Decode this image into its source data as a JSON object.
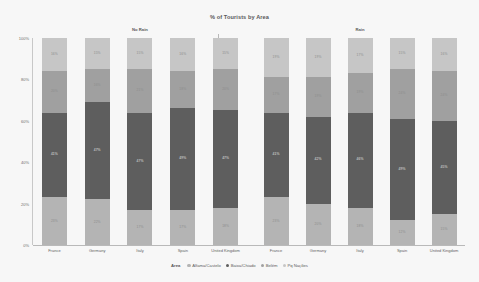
{
  "header": {
    "title": "% of Tourists by Area"
  },
  "axes": {
    "y_ticks": [
      "100%",
      "80%",
      "60%",
      "40%",
      "20%",
      "0%"
    ],
    "y_title": ""
  },
  "panels": [
    {
      "label": "No Rain"
    },
    {
      "label": "Rain"
    }
  ],
  "legend": {
    "title": "Area",
    "items": [
      {
        "label": "Alfama/Castelo",
        "color": "#b4b4b4"
      },
      {
        "label": "Baixa/Chiado",
        "color": "#5e5e5e"
      },
      {
        "label": "Belém",
        "color": "#a0a0a0"
      },
      {
        "label": "Pq Nações",
        "color": "#c6c6c6"
      }
    ]
  },
  "chart_data": {
    "type": "bar",
    "title": "% of Tourists by Area",
    "subtitle": "",
    "xlabel": "",
    "ylabel": "",
    "ylim": [
      0,
      100
    ],
    "stacked": true,
    "normalized_percent": true,
    "grid": false,
    "legend_position": "bottom",
    "legend_title": "Area",
    "facet_variable": "Rain",
    "facets": [
      "No Rain",
      "Rain"
    ],
    "categories": [
      "France",
      "Germany",
      "Italy",
      "Spain",
      "United Kingdom"
    ],
    "series_order": [
      "Alfama/Castelo",
      "Baixa/Chiado",
      "Belém",
      "Pq Nações"
    ],
    "series_colors": {
      "Alfama/Castelo": "#b4b4b4",
      "Baixa/Chiado": "#5e5e5e",
      "Belém": "#a0a0a0",
      "Pq Nações": "#c6c6c6"
    },
    "panels": [
      {
        "facet": "No Rain",
        "series": [
          {
            "name": "Alfama/Castelo",
            "values": [
              23,
              22,
              17,
              17,
              18
            ],
            "labels": [
              "23%",
              "22%",
              "17%",
              "17%",
              "18%"
            ]
          },
          {
            "name": "Baixa/Chiado",
            "values": [
              41,
              47,
              47,
              49,
              47
            ],
            "labels": [
              "41%",
              "47%",
              "47%",
              "49%",
              "47%"
            ]
          },
          {
            "name": "Belém",
            "values": [
              20,
              16,
              21,
              18,
              20
            ],
            "labels": [
              "20%",
              "16%",
              "21%",
              "18%",
              "20%"
            ]
          },
          {
            "name": "Pq Nações",
            "values": [
              16,
              15,
              15,
              16,
              15
            ],
            "labels": [
              "16%",
              "15%",
              "15%",
              "16%",
              "15%"
            ]
          }
        ]
      },
      {
        "facet": "Rain",
        "series": [
          {
            "name": "Alfama/Castelo",
            "values": [
              23,
              20,
              18,
              12,
              15
            ],
            "labels": [
              "23%",
              "20%",
              "18%",
              "12%",
              "15%"
            ]
          },
          {
            "name": "Baixa/Chiado",
            "values": [
              41,
              42,
              46,
              49,
              45
            ],
            "labels": [
              "41%",
              "42%",
              "46%",
              "49%",
              "45%"
            ]
          },
          {
            "name": "Belém",
            "values": [
              17,
              19,
              19,
              24,
              24
            ],
            "labels": [
              "17%",
              "19%",
              "19%",
              "24%",
              "24%"
            ]
          },
          {
            "name": "Pq Nações",
            "values": [
              19,
              19,
              17,
              15,
              16
            ],
            "labels": [
              "19%",
              "19%",
              "17%",
              "15%",
              "16%"
            ]
          }
        ]
      }
    ]
  }
}
